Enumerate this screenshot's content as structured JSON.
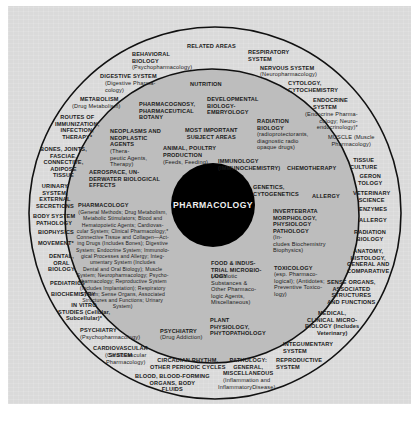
{
  "diagram": {
    "center": "PHARMACOLOGY",
    "colors": {
      "plate": "#dadada",
      "inner_zone": "#bdbdbd",
      "core": "#000000",
      "ring_line": "#111111",
      "text": "#1a1a1a"
    },
    "zones": {
      "related_title": "RELATED AREAS",
      "important_title": "MOST IMPORTANT\nSUBJECT AREAS"
    },
    "related_areas": [
      "BEHAVIORAL\nBIOLOGY",
      "(Psychopharmacology)",
      "RESPIRATORY\nSYSTEM",
      "NERVOUS SYSTEM",
      "(Neuropharmacology)",
      "DIGESTIVE SYSTEM",
      "(Digestive Pharma-\ncology)",
      "CYTOLOGY,\nCYTOCHEMISTRY",
      "METABOLISM",
      "(Drug Metabolism)",
      "ENDOCRINE\nSYSTEM",
      "(Endocrine Pharma-\ncology; Neuro-\nendocrinology)*",
      "ROUTES OF\nIMMUNIZATION,\nINFECTION,\nTHERAPY*",
      "MUSCLE (Muscle\nPharmacology)",
      "BONES, JOINTS,\nFASCIAE,\nCONNECTIVE,\nADIPOSE\nTISSUE",
      "TISSUE\nCULTURE",
      "GERON\nTOLOGY",
      "URINARY\nSYSTEM,\nEXTERNAL\nSECRETIONS",
      "VETERINARY\nSCIENCE",
      "BODY SYSTEM\nPATHOLOGY",
      "ENZYMES",
      "BIOPHYSICS",
      "ALLERGY",
      "MOVEMENT*",
      "RADIATION\nBIOLOGY",
      "DENTAL,\nORAL\nBIOLOGY",
      "ANATOMY,\nHISTOLOGY,\nGENERAL AND\nCOMPARATIVE",
      "PEDIATRICS",
      "SENSE ORGANS,\nASSOCIATED\nSTRUCTURES\nAND FUNCTIONS",
      "BIOCHEMISTRY",
      "IN VITRO\nSTUDIES (Cellular,\nSubcellular)*",
      "MEDICAL,\nCLINICAL MICRO-\nBIOLOGY (Includes\nVeterinary)",
      "PSYCHIATRY",
      "(Psychopharmacology)",
      "INTEGUMENTARY\nSYSTEM",
      "CARDIOVASCULAR\nSYSTEM",
      "(Cardiovascular\nPharmacology)",
      "REPRODUCTIVE\nSYSTEM",
      "CIRCADIAN RHYTHM,\nOTHER PERIODIC CYCLES",
      "PATHOLOGY:\nGENERAL,\nMISCELLANEOUS",
      "(Inflammation and\nInflammatoryDisease)",
      "BLOOD, BLOOD-FORMING\nORGANS, BODY\nFLUIDS"
    ],
    "important_areas": [
      "NUTRITION",
      "PHARMACOGNOSY,\nPHARMACEUTICAL\nBOTANY",
      "DEVELOPMENTAL\nBIOLOGY-\nEMBRYOLOGY",
      "RADIATION\nBIOLOGY",
      "(radioprotectorants,\ndiagnostic radio\nopaque drugs)",
      "NEOPLASMS AND\nNEOPLASTIC\nAGENTS",
      "(Thera-\npeutic Agents,\nTherapy)",
      "ANIMAL, POULTRY\nPRODUCTION",
      "(Feeds, Feeding)",
      "IMMUNOLOGY\n(IMMUNOCHEMISTRY)",
      "CHEMOTHERAPY",
      "AEROSPACE, UN-\nDERWATER BIOLOGICAL\nEFFECTS",
      "GENETICS,\nCYTOGENETICS",
      "ALLERGY",
      "INVERTEBRATA\nMORPHOLOGY,\nPHYSIOLOGY\nPATHOLOGY",
      "(In-\ncludes Biochemistry\nBiophysics)",
      "PHARMACOLOGY",
      "(General Methods; Drug Metabolism,\nMetabolic Stimulators; Blood and\nHematopoietic Agents; Cardiovas-\ncular System; Clinical Pharmacology;*\nConnective Tissue and Collagen—Act-\ning Drugs (Includes Bones); Digestive\nSystem; Endocrine System; Immunolo-\ngical Processes and Allergy; Integ-\numentary System (Includes\nDental and Oral Biology); Muscle\nSystem; Neuropharmacology; Psycho-\npharmacology; Reproductive System\n(Includes Implantation); Respiratory\nSystem; Sense Organs, Associated\nStructures and Functions; Urinary\nSystem)",
      "FOOD & INDUS-\nTRIAL MICROBIO-\nLOGY",
      "(Antibiotic\nSubstances &\nOther Pharmaco-\nlogic Agents,\nMiscellaneous)",
      "TOXICOLOGY",
      "(esp. Pharmaco-\nlogical); (Antidotes;\nPreventive Toxico-\nlogy)",
      "PSYCHIATRY",
      "(Drug Addiction)",
      "PLANT\nPHYSIOLOGY,\nPHYTOPATHOLOGY"
    ]
  }
}
